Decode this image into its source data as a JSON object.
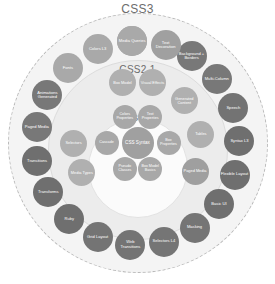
{
  "diagram": {
    "title_visible": false,
    "rings": [
      {
        "id": "css3",
        "label": "CSS3",
        "fill": "#f4f4f4",
        "stroke": "#b9b9b9",
        "stroke_style": "dashed"
      },
      {
        "id": "css21",
        "label": "CSS2.1",
        "fill": "#ececec",
        "stroke": "#dcdcdc",
        "stroke_style": "solid"
      },
      {
        "id": "css1",
        "label": "CSS1",
        "fill": "#fbfbfb",
        "stroke": "#e2e2e2",
        "stroke_style": "solid"
      }
    ],
    "palette": {
      "node_dark": "#6f6f6f",
      "node_mid": "#9b9b9b",
      "node_light": "#b4b4b4",
      "node_core": "#a6a6a6",
      "label_text": "#6d6d6d",
      "node_text": "#ffffff",
      "background": "#ffffff"
    },
    "core": {
      "label": "CSS Syntax",
      "color": "#a0a0a0",
      "angle": 0,
      "radius": 0
    },
    "nodes_css1": [
      {
        "label": "Text Properties",
        "color": "#a8a8a8",
        "angle": -64,
        "radius": 29
      },
      {
        "label": "Colors Properties",
        "color": "#a8a8a8",
        "angle": -116,
        "radius": 29
      },
      {
        "label": "Cascade",
        "color": "#a8a8a8",
        "angle": 180,
        "radius": 31
      },
      {
        "label": "Box Properties",
        "color": "#a8a8a8",
        "angle": 0,
        "radius": 31
      },
      {
        "label": "Pseudo Classes",
        "color": "#a8a8a8",
        "angle": 116,
        "radius": 29
      },
      {
        "label": "Box Model Basics",
        "color": "#a8a8a8",
        "angle": 64,
        "radius": 29
      }
    ],
    "nodes_css21": [
      {
        "label": "Box Model",
        "color": "#b0b0b0",
        "angle": -104,
        "radius": 62
      },
      {
        "label": "Visual Effects",
        "color": "#b0b0b0",
        "angle": -76,
        "radius": 62
      },
      {
        "label": "Generated Content",
        "color": "#b0b0b0",
        "angle": -42,
        "radius": 63
      },
      {
        "label": "Tables",
        "color": "#b0b0b0",
        "angle": -8,
        "radius": 64
      },
      {
        "label": "Paged Media",
        "color": "#9f9f9f",
        "angle": 26,
        "radius": 64
      },
      {
        "label": "Media Types",
        "color": "#b0b0b0",
        "angle": 152,
        "radius": 63
      },
      {
        "label": "Selectors",
        "color": "#b0b0b0",
        "angle": 180,
        "radius": 64
      }
    ],
    "nodes_css3": [
      {
        "label": "Text Decoration",
        "color": "#a2a2a2",
        "angle": -93,
        "radius": 102
      },
      {
        "label": "Colors L3",
        "color": "#a9a9a9",
        "angle": -113,
        "radius": 102
      },
      {
        "label": "Fonts",
        "color": "#a9a9a9",
        "angle": -133,
        "radius": 102
      },
      {
        "label": "Animations Generated",
        "color": "#787878",
        "angle": -152,
        "radius": 102
      },
      {
        "label": "Paged Media",
        "color": "#787878",
        "angle": -171,
        "radius": 102
      },
      {
        "label": "Transitions",
        "color": "#6f6f6f",
        "angle": 170,
        "radius": 102
      },
      {
        "label": "Transforms",
        "color": "#6f6f6f",
        "angle": 151,
        "radius": 102
      },
      {
        "label": "Ruby",
        "color": "#6f6f6f",
        "angle": 132,
        "radius": 102
      },
      {
        "label": "Grid Layout",
        "color": "#747474",
        "angle": 113,
        "radius": 102
      },
      {
        "label": "Web Transitions",
        "color": "#747474",
        "angle": 94,
        "radius": 102
      },
      {
        "label": "Selectors L4",
        "color": "#757575",
        "angle": 75,
        "radius": 102
      },
      {
        "label": "Masking",
        "color": "#757575",
        "angle": 56,
        "radius": 102
      },
      {
        "label": "Basic UI",
        "color": "#6f6f6f",
        "angle": 37,
        "radius": 102
      },
      {
        "label": "Flexible Layout",
        "color": "#6f6f6f",
        "angle": 18,
        "radius": 102
      },
      {
        "label": "Syntax L3",
        "color": "#6f6f6f",
        "angle": -1,
        "radius": 102
      },
      {
        "label": "Speech",
        "color": "#737373",
        "angle": -20,
        "radius": 102
      },
      {
        "label": "Multi-Column",
        "color": "#787878",
        "angle": -39,
        "radius": 102
      },
      {
        "label": "Background + Borders",
        "color": "#787878",
        "angle": -58,
        "radius": 102
      },
      {
        "label": "Text Decoration",
        "color": "#a0a0a0",
        "angle": -74,
        "radius": 102
      },
      {
        "label": "Media Queries",
        "color": "#a9a9a9",
        "angle": -93,
        "radius": 102
      }
    ]
  }
}
